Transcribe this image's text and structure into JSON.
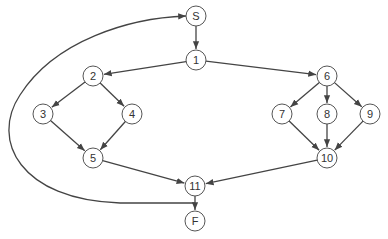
{
  "diagram": {
    "type": "control-flow-graph",
    "colors": {
      "stroke": "#444444",
      "node_fill": "#ffffff",
      "text": "#333333"
    },
    "node_radius": 10,
    "nodes": [
      {
        "id": "S",
        "label": "S",
        "x": 196,
        "y": 16
      },
      {
        "id": "1",
        "label": "1",
        "x": 196,
        "y": 60
      },
      {
        "id": "2",
        "label": "2",
        "x": 93,
        "y": 76
      },
      {
        "id": "3",
        "label": "3",
        "x": 43,
        "y": 114
      },
      {
        "id": "4",
        "label": "4",
        "x": 132,
        "y": 114
      },
      {
        "id": "5",
        "label": "5",
        "x": 93,
        "y": 158
      },
      {
        "id": "6",
        "label": "6",
        "x": 327,
        "y": 76
      },
      {
        "id": "7",
        "label": "7",
        "x": 282,
        "y": 114
      },
      {
        "id": "8",
        "label": "8",
        "x": 327,
        "y": 114
      },
      {
        "id": "9",
        "label": "9",
        "x": 370,
        "y": 114
      },
      {
        "id": "10",
        "label": "10",
        "x": 327,
        "y": 158
      },
      {
        "id": "11",
        "label": "11",
        "x": 195,
        "y": 186
      },
      {
        "id": "F",
        "label": "F",
        "x": 195,
        "y": 221
      }
    ],
    "edges": [
      {
        "from": "S",
        "to": "1"
      },
      {
        "from": "1",
        "to": "2"
      },
      {
        "from": "1",
        "to": "6"
      },
      {
        "from": "2",
        "to": "3"
      },
      {
        "from": "2",
        "to": "4"
      },
      {
        "from": "3",
        "to": "5"
      },
      {
        "from": "4",
        "to": "5"
      },
      {
        "from": "5",
        "to": "11"
      },
      {
        "from": "6",
        "to": "7"
      },
      {
        "from": "6",
        "to": "8"
      },
      {
        "from": "6",
        "to": "9"
      },
      {
        "from": "7",
        "to": "10"
      },
      {
        "from": "8",
        "to": "10"
      },
      {
        "from": "9",
        "to": "10"
      },
      {
        "from": "10",
        "to": "11"
      },
      {
        "from": "11",
        "to": "F"
      }
    ],
    "back_edge": {
      "from": "11-F-edge",
      "to": "S",
      "path": "M195,203 L120,203 C20,200 -10,140 20,95 C55,40 130,18 186,16"
    }
  }
}
